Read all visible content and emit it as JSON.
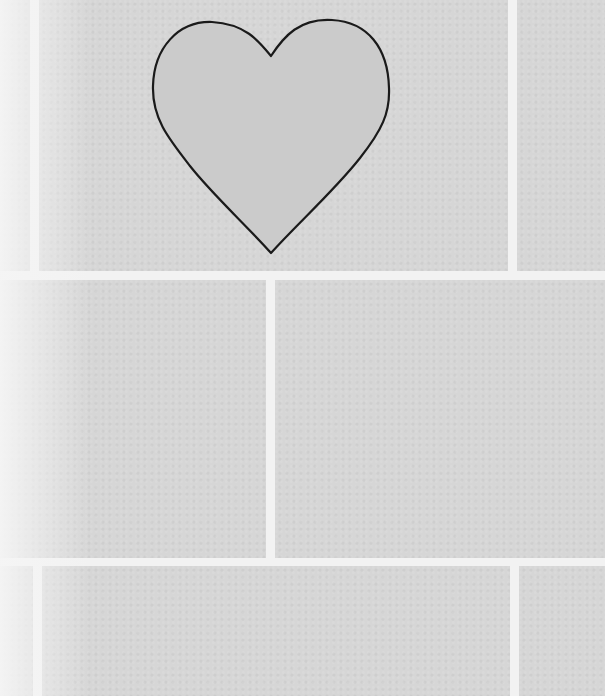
{
  "scene": {
    "description": "Grey tiled wall with white grout lines and a heart outline drawn on the top-center tile",
    "colors": {
      "tile": "#d6d6d6",
      "grout": "#f2f2f2",
      "heart_fill": "#cbcbcb",
      "heart_stroke": "#1a1a1a"
    },
    "rows": [
      {
        "top": 0,
        "height": 271,
        "tiles": [
          [
            0,
            30
          ],
          [
            39,
            508
          ],
          [
            517,
            605
          ]
        ]
      },
      {
        "top": 280,
        "height": 278,
        "tiles": [
          [
            0,
            266
          ],
          [
            275,
            605
          ]
        ]
      },
      {
        "top": 566,
        "height": 130,
        "tiles": [
          [
            0,
            33
          ],
          [
            42,
            510
          ],
          [
            519,
            605
          ]
        ]
      }
    ],
    "shape": "heart"
  }
}
